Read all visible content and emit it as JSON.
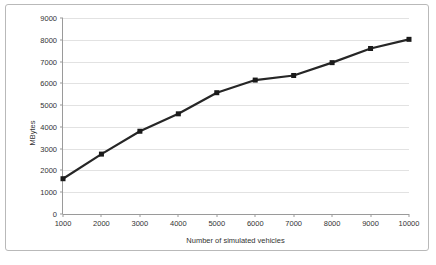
{
  "chart_data": {
    "type": "line",
    "title": "",
    "xlabel": "Number of simulated vehicles",
    "ylabel": "MBytes",
    "x": [
      1000,
      2000,
      3000,
      4000,
      5000,
      6000,
      7000,
      8000,
      9000,
      10000
    ],
    "values": [
      1620,
      2750,
      3800,
      4600,
      5570,
      6150,
      6360,
      6950,
      7600,
      8020
    ],
    "series": [
      {
        "name": "MBytes",
        "values": [
          1620,
          2750,
          3800,
          4600,
          5570,
          6150,
          6360,
          6950,
          7600,
          8020
        ]
      }
    ],
    "xtick_labels": [
      "1000",
      "2000",
      "3000",
      "4000",
      "5000",
      "6000",
      "7000",
      "8000",
      "9000",
      "10000"
    ],
    "ytick_labels": [
      "0",
      "1000",
      "2000",
      "3000",
      "4000",
      "5000",
      "6000",
      "7000",
      "8000",
      "9000"
    ],
    "yticks": [
      0,
      1000,
      2000,
      3000,
      4000,
      5000,
      6000,
      7000,
      8000,
      9000
    ],
    "xlim": [
      1000,
      10000
    ],
    "ylim": [
      0,
      9000
    ],
    "grid": "horizontal",
    "legend": "none",
    "colors": {
      "line": "#262626",
      "marker": "#1a1a1a",
      "gridline": "#e2e2e2",
      "axis": "#9a9a9a",
      "frame": "#b9b9b9",
      "background": "#ffffff",
      "text": "#333333"
    },
    "marker": "square",
    "line_width": 2.2,
    "marker_size": 5
  }
}
